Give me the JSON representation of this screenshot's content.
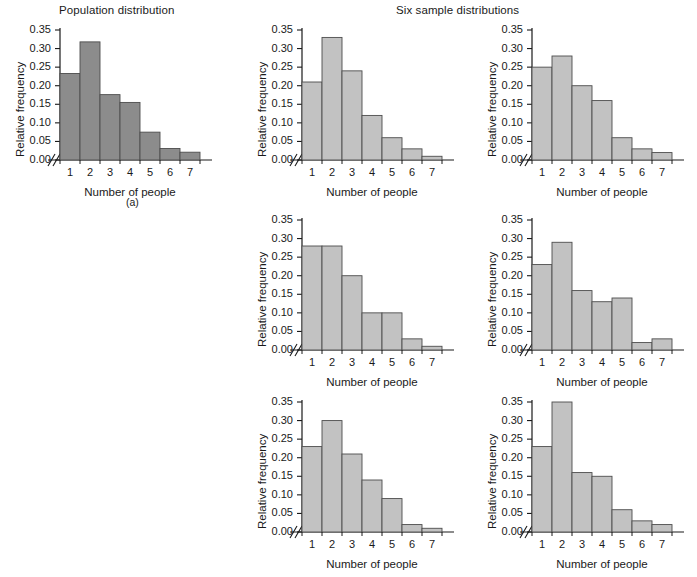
{
  "figure": {
    "population_title": "Population distribution",
    "samples_title": "Six sample distributions",
    "panel_caption": "(a)",
    "axis": {
      "xlabel": "Number of people",
      "ylabel": "Relative frequency",
      "ytick_labels": [
        "0.00",
        "0.05",
        "0.10",
        "0.15",
        "0.20",
        "0.25",
        "0.30",
        "0.35"
      ],
      "xtick_labels": [
        "1",
        "2",
        "3",
        "4",
        "5",
        "6",
        "7"
      ],
      "ylim": [
        0.0,
        0.35
      ],
      "axis_break": "//"
    },
    "colors": {
      "population_bar_fill": "#8c8c8c",
      "sample_bar_fill": "#c2c2c2",
      "bar_stroke": "#4d4d4d",
      "axis": "#1a1a1a",
      "background": "#ffffff"
    }
  },
  "chart_data": [
    {
      "id": "population",
      "type": "bar",
      "title": "Population distribution",
      "xlabel": "Number of people",
      "ylabel": "Relative frequency",
      "categories": [
        "1",
        "2",
        "3",
        "4",
        "5",
        "6",
        "7"
      ],
      "values": [
        0.233,
        0.318,
        0.176,
        0.155,
        0.075,
        0.031,
        0.021
      ],
      "ylim": [
        0.0,
        0.35
      ],
      "yticks": [
        0.0,
        0.05,
        0.1,
        0.15,
        0.2,
        0.25,
        0.3,
        0.35
      ],
      "grid": false,
      "legend": "none"
    },
    {
      "id": "sample-1",
      "type": "bar",
      "title": "Six sample distributions",
      "xlabel": "Number of people",
      "ylabel": "Relative frequency",
      "categories": [
        "1",
        "2",
        "3",
        "4",
        "5",
        "6",
        "7"
      ],
      "values": [
        0.21,
        0.33,
        0.24,
        0.12,
        0.06,
        0.03,
        0.01
      ],
      "ylim": [
        0.0,
        0.35
      ],
      "yticks": [
        0.0,
        0.05,
        0.1,
        0.15,
        0.2,
        0.25,
        0.3,
        0.35
      ],
      "grid": false,
      "legend": "none"
    },
    {
      "id": "sample-2",
      "type": "bar",
      "title": "",
      "xlabel": "Number of people",
      "ylabel": "Relative frequency",
      "categories": [
        "1",
        "2",
        "3",
        "4",
        "5",
        "6",
        "7"
      ],
      "values": [
        0.25,
        0.28,
        0.2,
        0.16,
        0.06,
        0.03,
        0.02
      ],
      "ylim": [
        0.0,
        0.35
      ],
      "yticks": [
        0.0,
        0.05,
        0.1,
        0.15,
        0.2,
        0.25,
        0.3,
        0.35
      ],
      "grid": false,
      "legend": "none"
    },
    {
      "id": "sample-3",
      "type": "bar",
      "title": "",
      "xlabel": "Number of people",
      "ylabel": "Relative frequency",
      "categories": [
        "1",
        "2",
        "3",
        "4",
        "5",
        "6",
        "7"
      ],
      "values": [
        0.28,
        0.28,
        0.2,
        0.1,
        0.1,
        0.03,
        0.01
      ],
      "ylim": [
        0.0,
        0.35
      ],
      "yticks": [
        0.0,
        0.05,
        0.1,
        0.15,
        0.2,
        0.25,
        0.3,
        0.35
      ],
      "grid": false,
      "legend": "none"
    },
    {
      "id": "sample-4",
      "type": "bar",
      "title": "",
      "xlabel": "Number of people",
      "ylabel": "Relative frequency",
      "categories": [
        "1",
        "2",
        "3",
        "4",
        "5",
        "6",
        "7"
      ],
      "values": [
        0.23,
        0.29,
        0.16,
        0.13,
        0.14,
        0.02,
        0.03
      ],
      "ylim": [
        0.0,
        0.35
      ],
      "yticks": [
        0.0,
        0.05,
        0.1,
        0.15,
        0.2,
        0.25,
        0.3,
        0.35
      ],
      "grid": false,
      "legend": "none"
    },
    {
      "id": "sample-5",
      "type": "bar",
      "title": "",
      "xlabel": "Number of people",
      "ylabel": "Relative frequency",
      "categories": [
        "1",
        "2",
        "3",
        "4",
        "5",
        "6",
        "7"
      ],
      "values": [
        0.23,
        0.3,
        0.21,
        0.14,
        0.09,
        0.02,
        0.01
      ],
      "ylim": [
        0.0,
        0.35
      ],
      "yticks": [
        0.0,
        0.05,
        0.1,
        0.15,
        0.2,
        0.25,
        0.3,
        0.35
      ],
      "grid": false,
      "legend": "none"
    },
    {
      "id": "sample-6",
      "type": "bar",
      "title": "",
      "xlabel": "Number of people",
      "ylabel": "Relative frequency",
      "categories": [
        "1",
        "2",
        "3",
        "4",
        "5",
        "6",
        "7"
      ],
      "values": [
        0.23,
        0.35,
        0.16,
        0.15,
        0.06,
        0.03,
        0.02
      ],
      "ylim": [
        0.0,
        0.35
      ],
      "yticks": [
        0.0,
        0.05,
        0.1,
        0.15,
        0.2,
        0.25,
        0.3,
        0.35
      ],
      "grid": false,
      "legend": "none"
    }
  ],
  "layout": {
    "panels": [
      {
        "chart_index": 0,
        "left": 0,
        "top": 18
      },
      {
        "chart_index": 1,
        "left": 242,
        "top": 18
      },
      {
        "chart_index": 2,
        "left": 472,
        "top": 18
      },
      {
        "chart_index": 3,
        "left": 242,
        "top": 208
      },
      {
        "chart_index": 4,
        "left": 472,
        "top": 208
      },
      {
        "chart_index": 5,
        "left": 242,
        "top": 390
      },
      {
        "chart_index": 6,
        "left": 472,
        "top": 390
      }
    ]
  }
}
